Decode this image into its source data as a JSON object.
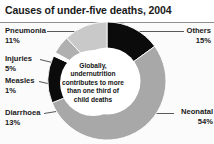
{
  "header": {
    "title": "Causes of under-five deaths, 2004"
  },
  "centre": {
    "text": "Globally, undernutrition contributes to more than one third of child deaths"
  },
  "labels": {
    "pneumonia": {
      "name": "Pneumonia",
      "pct": "11%"
    },
    "injuries": {
      "name": "Injuries",
      "pct": "5%"
    },
    "measles": {
      "name": "Measles",
      "pct": "1%"
    },
    "diarrhoea": {
      "name": "Diarrhoea",
      "pct": "13%"
    },
    "others": {
      "name": "Others",
      "pct": "15%"
    },
    "neonatal": {
      "name": "Neonatal",
      "pct": "54%"
    }
  },
  "colors": {
    "others": "#0b0b0b",
    "neonatal": "#a8a8a8",
    "diarrhoea": "#0b0b0b",
    "measles": "#fdfdfd",
    "injuries": "#b0b0b0",
    "pneumonia": "#c9c9c9",
    "title": "#1a1a1a",
    "leader": "#5a5a5a",
    "background": "#fbfbfb"
  },
  "chart_data": {
    "type": "pie",
    "title": "Causes of under-five deaths, 2004",
    "subtitle": "",
    "xlabel": "",
    "ylabel": "",
    "donut": true,
    "center_note": "Globally, undernutrition contributes to more than one third of child deaths",
    "legend_position": "outside-labels",
    "grid": false,
    "units": "percent of under-five deaths",
    "start_angle_deg": 0,
    "direction": "clockwise",
    "categories": [
      "Others",
      "Neonatal",
      "Diarrhoea",
      "Measles",
      "Injuries",
      "Pneumonia"
    ],
    "values": [
      15,
      54,
      13,
      1,
      5,
      11
    ],
    "slices": [
      {
        "label": "Others",
        "value": 15,
        "display": "15%",
        "color": "#0b0b0b",
        "start_deg": 0,
        "end_deg": 54
      },
      {
        "label": "Neonatal",
        "value": 54,
        "display": "54%",
        "color": "#a8a8a8",
        "start_deg": 54,
        "end_deg": 248.4
      },
      {
        "label": "Diarrhoea",
        "value": 13,
        "display": "13%",
        "color": "#0b0b0b",
        "start_deg": 248.4,
        "end_deg": 295.2
      },
      {
        "label": "Measles",
        "value": 1,
        "display": "1%",
        "color": "#fdfdfd",
        "start_deg": 295.2,
        "end_deg": 298.8
      },
      {
        "label": "Injuries",
        "value": 5,
        "display": "5%",
        "color": "#b0b0b0",
        "start_deg": 298.8,
        "end_deg": 316.8
      },
      {
        "label": "Pneumonia",
        "value": 11,
        "display": "11%",
        "color": "#c9c9c9",
        "start_deg": 316.8,
        "end_deg": 360
      }
    ],
    "total": 99
  }
}
